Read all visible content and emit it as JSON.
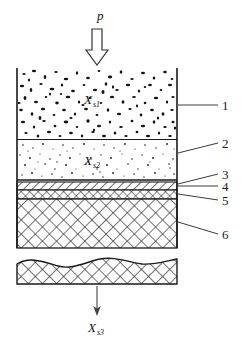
{
  "figure": {
    "pressure_label": "p",
    "zone_labels": [
      {
        "base": "X",
        "sub": "s1",
        "name": "zone-1-variable"
      },
      {
        "base": "X",
        "sub": "s2",
        "name": "zone-2-variable"
      },
      {
        "base": "X",
        "sub": "s3",
        "name": "outflow-variable"
      }
    ],
    "callouts": [
      {
        "id": "1",
        "text": "1"
      },
      {
        "id": "2",
        "text": "2"
      },
      {
        "id": "3",
        "text": "3"
      },
      {
        "id": "4",
        "text": "4"
      },
      {
        "id": "5",
        "text": "5"
      },
      {
        "id": "6",
        "text": "6"
      }
    ],
    "colors": {
      "line": "#1a1a1a",
      "particle": "#111111",
      "hatch": "#333333",
      "background": "#ffffff",
      "leader": "#3a3a3a"
    },
    "geometry": {
      "wall_left_x": 17,
      "wall_right_x": 177,
      "wall_top_y": 68,
      "wall_bottom_y": 248,
      "boundary_zone1_zone2_y": 139,
      "boundary_zone2_layer_y": 180,
      "layer4_top_y": 182,
      "layer4_bottom_y": 190,
      "layer5_top_y": 190,
      "layer5_bottom_y": 199,
      "layer6_top_y": 199,
      "detached_block_top_y": 258,
      "detached_block_bottom_y": 284
    }
  }
}
